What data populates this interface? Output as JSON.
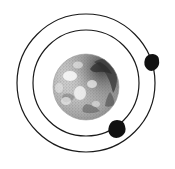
{
  "figure": {
    "title": "Mars with two orbiting moons",
    "subject_label": "Mars",
    "background_color": "#ffffff",
    "line_color": "#1a1a1a",
    "moon_color": "#111111",
    "width": 175,
    "height": 169
  },
  "planet": {
    "name": "Mars",
    "center_x": 86,
    "center_y": 87,
    "radius": 33,
    "surface_style": "halftone-mottled-grayscale",
    "base_color": "#b9b9b9",
    "highlight_color": "#f2f2f2",
    "shadow_color": "#4a4a4a",
    "limb_shadow_side": "upper-right"
  },
  "orbits": [
    {
      "name": "outer-orbit",
      "moon": "Deimos",
      "center_x": 86,
      "center_y": 83,
      "radius": 69,
      "stroke_width": 1.2
    },
    {
      "name": "inner-orbit",
      "moon": "Phobos",
      "center_x": 86,
      "center_y": 83,
      "radius": 53,
      "stroke_width": 1.2
    }
  ],
  "moons": [
    {
      "name": "Deimos",
      "orbit": "outer-orbit",
      "center_x": 153,
      "center_y": 61,
      "width": 13,
      "height": 14,
      "position_description": "upper right on outer orbit"
    },
    {
      "name": "Phobos",
      "orbit": "inner-orbit",
      "center_x": 117,
      "center_y": 127,
      "width": 15,
      "height": 14,
      "position_description": "lower right on inner orbit"
    }
  ]
}
